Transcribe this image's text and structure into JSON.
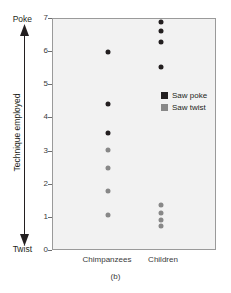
{
  "caption": "(b)",
  "axis": {
    "y_top_pole": "Poke",
    "y_bottom_pole": "Twist",
    "y_title": "Technique employed",
    "y_ticks": [
      "7",
      "6",
      "5",
      "4",
      "3",
      "2",
      "1",
      "0"
    ],
    "x_categories": [
      "Chimpanzees",
      "Children"
    ]
  },
  "legend": {
    "items": [
      {
        "label": "Saw poke",
        "color": "#231f20"
      },
      {
        "label": "Saw twist",
        "color": "#888888"
      }
    ]
  },
  "colors": {
    "saw_poke": "#231f20",
    "saw_twist": "#888888",
    "plot_background": "#f2f2f2",
    "plot_border": "#9a9a9a"
  },
  "chart_data": {
    "type": "scatter",
    "title": "(b)",
    "xlabel": "",
    "ylabel": "Technique employed",
    "ylim": [
      0,
      7
    ],
    "yticks": [
      0,
      1,
      2,
      3,
      4,
      5,
      6,
      7
    ],
    "y_axis_poles": {
      "top": "Poke",
      "bottom": "Twist"
    },
    "grid": false,
    "legend_position": "inside-right",
    "categories": [
      "Chimpanzees",
      "Children"
    ],
    "series": [
      {
        "name": "Saw poke",
        "color": "#231f20",
        "points": [
          {
            "category": "Chimpanzees",
            "value": 6.0
          },
          {
            "category": "Chimpanzees",
            "value": 4.45
          },
          {
            "category": "Chimpanzees",
            "value": 3.55
          },
          {
            "category": "Children",
            "value": 6.9
          },
          {
            "category": "Children",
            "value": 6.65
          },
          {
            "category": "Children",
            "value": 6.3
          },
          {
            "category": "Children",
            "value": 5.55
          }
        ]
      },
      {
        "name": "Saw twist",
        "color": "#888888",
        "points": [
          {
            "category": "Chimpanzees",
            "value": 3.05
          },
          {
            "category": "Chimpanzees",
            "value": 2.5
          },
          {
            "category": "Chimpanzees",
            "value": 1.8
          },
          {
            "category": "Chimpanzees",
            "value": 1.1
          },
          {
            "category": "Children",
            "value": 1.4
          },
          {
            "category": "Children",
            "value": 1.15
          },
          {
            "category": "Children",
            "value": 0.95
          },
          {
            "category": "Children",
            "value": 0.75
          }
        ]
      }
    ]
  }
}
